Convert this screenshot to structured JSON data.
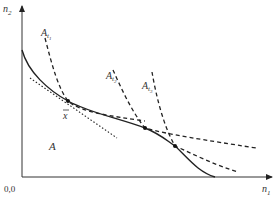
{
  "diagram": {
    "axes": {
      "y_label": "n",
      "y_label_sub": "2",
      "x_label": "n",
      "x_label_sub": "1",
      "origin_label": "0,0"
    },
    "regions": {
      "set_label": "A"
    },
    "points": {
      "xbar_label": "x"
    },
    "curves": [
      {
        "name": "A",
        "sub": "t1",
        "label": "A",
        "label_sub": "t",
        "label_subsub": "1"
      },
      {
        "name": "A",
        "sub": "t2",
        "label": "A",
        "label_sub": "t",
        "label_subsub": "2"
      },
      {
        "name": "A",
        "sub": "t3",
        "label": "A",
        "label_sub": "t",
        "label_subsub": "3"
      }
    ],
    "colors": {
      "line": "#222222",
      "text": "#333333",
      "background": "#ffffff"
    }
  }
}
